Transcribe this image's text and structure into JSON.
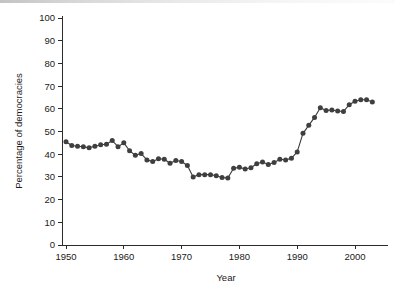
{
  "chart_data": {
    "type": "line",
    "title": "",
    "subtitle": "",
    "xlabel": "Year",
    "ylabel": "Percentage of democracies",
    "xlim": [
      1949,
      2004
    ],
    "ylim": [
      0,
      100
    ],
    "xticks": [
      1950,
      1960,
      1970,
      1980,
      1990,
      2000
    ],
    "xtick_labels": [
      "1950",
      "1960",
      "1970",
      "1980",
      "1990",
      "2000"
    ],
    "yticks": [
      0,
      10,
      20,
      30,
      40,
      50,
      60,
      70,
      80,
      90,
      100
    ],
    "ytick_labels": [
      "0",
      "10",
      "20",
      "30",
      "40",
      "50",
      "60",
      "70",
      "80",
      "90",
      "100"
    ],
    "grid": false,
    "legend": false,
    "legend_position": "none",
    "marker": "filled-circle",
    "marker_color": "#3f3f3f",
    "line_color": "#3a3a3a",
    "background_color": "#ffffff",
    "axis_color": "#2b2b2b",
    "series": [
      {
        "name": "Percentage of democracies",
        "x": [
          1950,
          1951,
          1952,
          1953,
          1954,
          1955,
          1956,
          1957,
          1958,
          1959,
          1960,
          1961,
          1962,
          1963,
          1964,
          1965,
          1966,
          1967,
          1968,
          1969,
          1970,
          1971,
          1972,
          1973,
          1974,
          1975,
          1976,
          1977,
          1978,
          1979,
          1980,
          1981,
          1982,
          1983,
          1984,
          1985,
          1986,
          1987,
          1988,
          1989,
          1990,
          1991,
          1992,
          1993,
          1994,
          1995,
          1996,
          1997,
          1998,
          1999,
          2000,
          2001,
          2002,
          2003
        ],
        "values": [
          45.5,
          43.8,
          43.5,
          43.3,
          42.8,
          43.5,
          44.2,
          44.4,
          46.0,
          43.3,
          45.0,
          41.5,
          39.5,
          40.3,
          37.5,
          36.8,
          38.0,
          37.8,
          36.0,
          37.2,
          36.8,
          35.0,
          30.0,
          31.0,
          31.0,
          31.0,
          30.5,
          29.7,
          29.5,
          33.8,
          34.2,
          33.5,
          34.0,
          35.8,
          36.6,
          35.5,
          36.3,
          37.8,
          37.5,
          38.2,
          41.0,
          49.2,
          52.7,
          56.2,
          60.5,
          59.3,
          59.5,
          59.0,
          58.8,
          61.8,
          63.3,
          64.0,
          64.0,
          63.0
        ]
      }
    ]
  }
}
